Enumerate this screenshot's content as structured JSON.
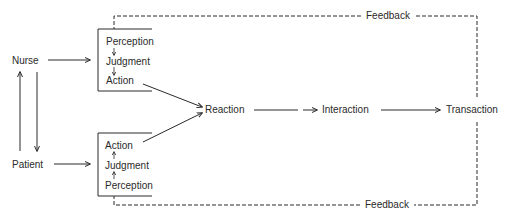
{
  "diagram": {
    "title": "",
    "nodes": {
      "nurse": "Nurse",
      "patient": "Patient",
      "nurse_box": {
        "perception": "Perception",
        "judgment": "Judgment",
        "action": "Action"
      },
      "patient_box": {
        "action": "Action",
        "judgment": "Judgment",
        "perception": "Perception"
      },
      "reaction": "Reaction",
      "interaction": "Interaction",
      "transaction": "Transaction"
    },
    "feedback": {
      "top": "Feedback",
      "bottom": "Feedback"
    },
    "edges": [
      {
        "from": "Nurse",
        "to": "Patient",
        "style": "solid"
      },
      {
        "from": "Patient",
        "to": "Nurse",
        "style": "solid"
      },
      {
        "from": "Nurse",
        "to": "Nurse box (Perception/Judgment/Action)",
        "style": "solid"
      },
      {
        "from": "Patient",
        "to": "Patient box (Perception/Judgment/Action)",
        "style": "solid"
      },
      {
        "from": "Perception",
        "to": "Judgment",
        "style": "solid"
      },
      {
        "from": "Judgment",
        "to": "Action",
        "style": "solid"
      },
      {
        "from": "Nurse Action",
        "to": "Reaction",
        "style": "solid"
      },
      {
        "from": "Patient Action",
        "to": "Reaction",
        "style": "solid"
      },
      {
        "from": "Reaction",
        "to": "Interaction",
        "style": "solid"
      },
      {
        "from": "Interaction",
        "to": "Transaction",
        "style": "solid"
      },
      {
        "from": "Transaction",
        "to": "Nurse box",
        "style": "dashed",
        "label": "Feedback"
      },
      {
        "from": "Transaction",
        "to": "Patient box",
        "style": "dashed",
        "label": "Feedback"
      }
    ],
    "colors": {
      "ink": "#2a2a2a",
      "background": "#ffffff"
    }
  }
}
